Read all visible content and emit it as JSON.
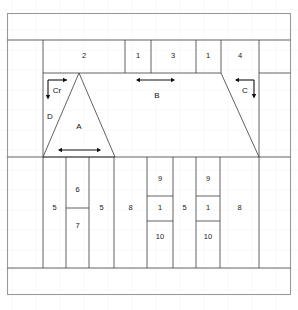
{
  "figure": {
    "caption": "",
    "colors": {
      "line": "#3a3a3a",
      "frame": "#9a9a9a",
      "grid": "#f2f2f2",
      "text": "#1a1a1a",
      "arrow": "#111111"
    }
  },
  "top_band": {
    "cells": [
      {
        "label": "2"
      },
      {
        "label": "1"
      },
      {
        "label": "3"
      },
      {
        "label": "1"
      },
      {
        "label": "4"
      }
    ]
  },
  "middle_band": {
    "shapes": [
      {
        "name": "triangle",
        "label": "A"
      },
      {
        "name": "right-trapezoid",
        "label": ""
      }
    ],
    "region_labels": [
      {
        "label": "D"
      },
      {
        "label": "Cr"
      },
      {
        "label": "B"
      },
      {
        "label": "C"
      },
      {
        "label": "A"
      }
    ],
    "dimension_arrows": [
      {
        "name": "arrow-cr",
        "label": "Cr"
      },
      {
        "name": "arrow-b",
        "label": "B"
      },
      {
        "name": "arrow-c",
        "label": "C"
      },
      {
        "name": "arrow-a",
        "label": "A"
      }
    ]
  },
  "bottom_band": {
    "columns": [
      {
        "label": "5"
      },
      {
        "stacked": [
          {
            "label": "6"
          },
          {
            "label": "7"
          }
        ]
      },
      {
        "label": "5"
      },
      {
        "label": "8"
      },
      {
        "stacked": [
          {
            "label": "9"
          },
          {
            "label": "1"
          },
          {
            "label": "10"
          }
        ]
      },
      {
        "label": "5"
      },
      {
        "stacked": [
          {
            "label": "9"
          },
          {
            "label": "1"
          },
          {
            "label": "10"
          }
        ]
      },
      {
        "label": "8"
      }
    ]
  }
}
